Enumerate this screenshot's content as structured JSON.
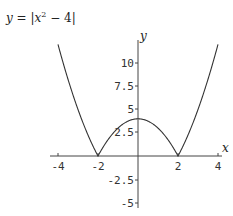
{
  "chart_data": {
    "type": "line",
    "xlabel": "x",
    "ylabel": "y",
    "xlim": [
      -4,
      4
    ],
    "ylim": [
      -5,
      12
    ],
    "grid": false,
    "x_ticks": [
      "-4",
      "-2",
      "2",
      "4"
    ],
    "y_ticks": [
      "10",
      "7.5",
      "5",
      "2.5",
      "-2.5",
      "-5"
    ],
    "series": [
      {
        "name": "|x^2 - 4|",
        "x": [
          -4,
          -3.5,
          -3,
          -2.5,
          -2,
          -1.5,
          -1,
          -0.5,
          0,
          0.5,
          1,
          1.5,
          2,
          2.5,
          3,
          3.5,
          4
        ],
        "y": [
          12,
          8.25,
          5,
          2.25,
          0,
          1.75,
          3,
          3.75,
          4,
          3.75,
          3,
          1.75,
          0,
          2.25,
          5,
          8.25,
          12
        ]
      }
    ]
  },
  "title": {
    "lhs": "y",
    "eq": " = |",
    "x": "x",
    "sup": "2",
    "rest": " − 4|"
  },
  "axes": {
    "x_label": "x",
    "y_label": "y",
    "x_ticks": [
      "-4",
      "-2",
      "2",
      "4"
    ],
    "y_ticks": [
      "10",
      "7.5",
      "5",
      "2.5",
      "-2.5",
      "-5"
    ]
  }
}
